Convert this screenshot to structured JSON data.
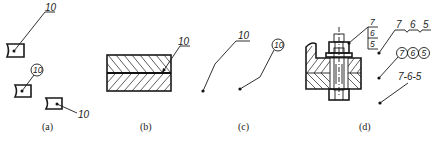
{
  "figure": {
    "panels": [
      {
        "id": "a",
        "caption": "(a)",
        "callouts": [
          {
            "style": "underline",
            "label": "10"
          },
          {
            "style": "circle",
            "label": "10"
          },
          {
            "style": "plain",
            "label": "10"
          }
        ]
      },
      {
        "id": "b",
        "caption": "(b)",
        "callouts": [
          {
            "style": "underline-arrow",
            "label": "10"
          }
        ]
      },
      {
        "id": "c",
        "caption": "(c)",
        "callouts": [
          {
            "style": "underline",
            "label": "10"
          },
          {
            "style": "circle",
            "label": "10"
          }
        ]
      },
      {
        "id": "d",
        "caption": "(d)",
        "stack_labels": [
          "7",
          "6",
          "5"
        ],
        "callouts": [
          {
            "style": "underline-group",
            "labels": [
              "7",
              "6",
              "5"
            ]
          },
          {
            "style": "circle-group",
            "labels": [
              "7",
              "6",
              "5"
            ]
          },
          {
            "style": "dashed-group",
            "label": "7-6-5"
          }
        ]
      }
    ]
  }
}
